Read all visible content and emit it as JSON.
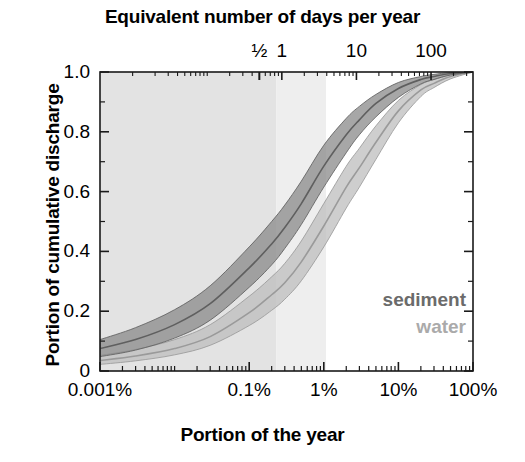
{
  "figure": {
    "top_axis_title": "Equivalent number of days per year",
    "bottom_axis_title": "Portion of the year",
    "y_axis_title": "Portion of cumulative discharge"
  },
  "legend": {
    "sediment_label": "sediment",
    "water_label": "water",
    "sediment_color": "#6b6b6b",
    "water_color": "#aaaaaa"
  },
  "colors": {
    "sediment_band": "#8a8a8a",
    "sediment_line": "#5f5f5f",
    "water_band": "#bdbdbd",
    "water_line": "#9a9a9a",
    "shade_dark": "#e3e3e3",
    "shade_light": "#eeeeee",
    "axis": "#1a1a1a"
  },
  "chart_data": {
    "type": "line",
    "title": "Equivalent number of days per year",
    "xlabel": "Portion of the year",
    "ylabel": "Portion of cumulative discharge",
    "x_scale": "log",
    "xlim_percent": [
      0.001,
      100
    ],
    "ylim": [
      0,
      1.0
    ],
    "grid": false,
    "legend_position": "inside-bottom-right",
    "x_tick_labels_bottom": [
      "0.001%",
      "0.1%",
      "1%",
      "10%",
      "100%"
    ],
    "x_tick_values_percent": [
      0.001,
      0.1,
      1,
      10,
      100
    ],
    "x_tick_labels_top": [
      "½",
      "1",
      "10",
      "100"
    ],
    "x_tick_values_top_days": [
      0.5,
      1,
      10,
      100
    ],
    "y_tick_labels": [
      "1.0",
      "0.8",
      "0.6",
      "0.4",
      "0.2",
      "0"
    ],
    "y_tick_values": [
      1.0,
      0.8,
      0.6,
      0.4,
      0.2,
      0
    ],
    "y_minor_tick_values": [
      0.9,
      0.7,
      0.5,
      0.3,
      0.1
    ],
    "shaded_regions": [
      {
        "name": "region-dark",
        "x_start_percent": 0.001,
        "x_end_percent": 0.23,
        "color": "#e3e3e3"
      },
      {
        "name": "region-light",
        "x_start_percent": 0.23,
        "x_end_percent": 1.07,
        "color": "#eeeeee"
      }
    ],
    "series": [
      {
        "name": "sediment",
        "kind": "band-with-median",
        "color": "#8a8a8a",
        "x_percent": [
          0.001,
          0.003,
          0.01,
          0.03,
          0.1,
          0.2,
          0.3,
          0.5,
          1,
          2,
          3,
          5,
          10,
          20,
          30,
          50,
          100
        ],
        "median": [
          0.075,
          0.105,
          0.155,
          0.225,
          0.345,
          0.425,
          0.48,
          0.56,
          0.685,
          0.79,
          0.84,
          0.895,
          0.945,
          0.975,
          0.985,
          0.995,
          1.0
        ],
        "upper": [
          0.105,
          0.145,
          0.205,
          0.285,
          0.415,
          0.5,
          0.555,
          0.635,
          0.755,
          0.845,
          0.885,
          0.925,
          0.965,
          0.985,
          0.992,
          0.998,
          1.0
        ],
        "lower": [
          0.048,
          0.07,
          0.11,
          0.17,
          0.28,
          0.355,
          0.41,
          0.49,
          0.615,
          0.73,
          0.79,
          0.85,
          0.915,
          0.96,
          0.975,
          0.99,
          1.0
        ]
      },
      {
        "name": "water",
        "kind": "band-with-median",
        "color": "#bdbdbd",
        "x_percent": [
          0.001,
          0.003,
          0.01,
          0.03,
          0.1,
          0.2,
          0.3,
          0.5,
          1,
          2,
          3,
          5,
          10,
          20,
          30,
          50,
          100
        ],
        "median": [
          0.035,
          0.05,
          0.075,
          0.115,
          0.195,
          0.255,
          0.295,
          0.365,
          0.485,
          0.615,
          0.68,
          0.765,
          0.87,
          0.94,
          0.962,
          0.985,
          1.0
        ],
        "upper": [
          0.052,
          0.072,
          0.105,
          0.155,
          0.25,
          0.315,
          0.36,
          0.435,
          0.56,
          0.685,
          0.745,
          0.82,
          0.905,
          0.958,
          0.975,
          0.99,
          1.0
        ],
        "lower": [
          0.022,
          0.034,
          0.054,
          0.086,
          0.152,
          0.203,
          0.24,
          0.302,
          0.415,
          0.545,
          0.615,
          0.708,
          0.83,
          0.918,
          0.948,
          0.977,
          1.0
        ]
      }
    ]
  }
}
